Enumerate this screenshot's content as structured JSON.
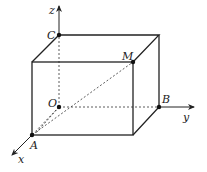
{
  "diagram": {
    "type": "3d-rectangular-box-in-coordinate-system",
    "axes": [
      {
        "name": "x",
        "label": "x"
      },
      {
        "name": "y",
        "label": "y"
      },
      {
        "name": "z",
        "label": "z"
      }
    ],
    "points": [
      {
        "id": "O",
        "label": "O",
        "desc": "origin"
      },
      {
        "id": "A",
        "label": "A",
        "desc": "on x-axis"
      },
      {
        "id": "B",
        "label": "B",
        "desc": "on y-axis"
      },
      {
        "id": "C",
        "label": "C",
        "desc": "on z-axis"
      },
      {
        "id": "M",
        "label": "M",
        "desc": "vertex opposite O"
      }
    ],
    "segments": {
      "solid": [
        "box visible edges"
      ],
      "dashed": [
        "OC",
        "OB",
        "OA",
        "OM",
        "AM"
      ]
    },
    "colors": {
      "line": "#222222",
      "background": "#ffffff"
    }
  }
}
